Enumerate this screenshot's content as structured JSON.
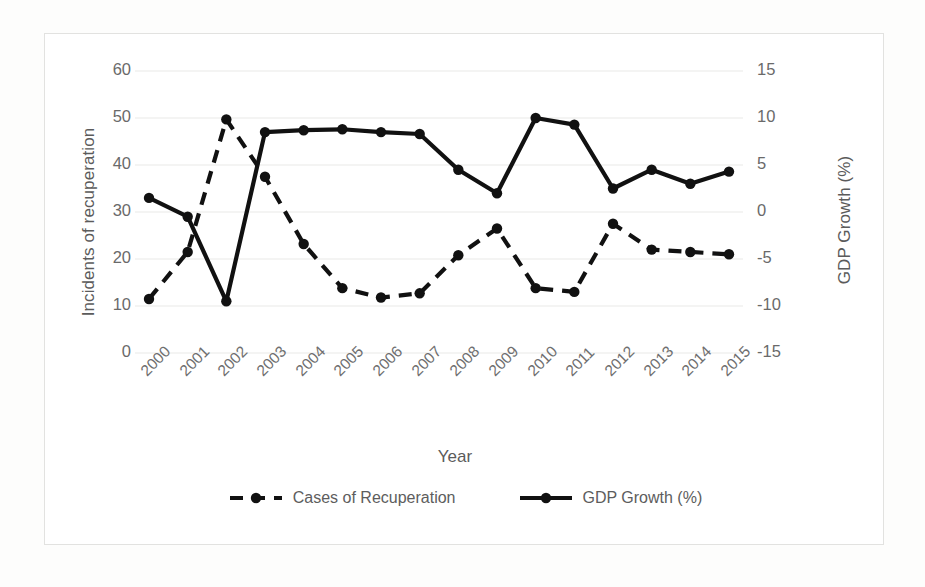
{
  "chart_data": {
    "type": "line",
    "title": "",
    "xlabel": "Year",
    "ylabel": "Incidents of recuperation",
    "y2label": "GDP Growth (%)",
    "categories": [
      "2000",
      "2001",
      "2002",
      "2003",
      "2004",
      "2005",
      "2006",
      "2007",
      "2008",
      "2009",
      "2010",
      "2011",
      "2012",
      "2013",
      "2014",
      "2015"
    ],
    "ylim": [
      0,
      60
    ],
    "yticks": [
      "0",
      "10",
      "20",
      "30",
      "40",
      "50",
      "60"
    ],
    "y2lim": [
      -15,
      15
    ],
    "y2ticks": [
      "-15",
      "-10",
      "-5",
      "0",
      "5",
      "10",
      "15"
    ],
    "grid": true,
    "legend_position": "bottom",
    "series": [
      {
        "name": "Cases of Recuperation",
        "axis": "left",
        "style": "dashed",
        "marker": "circle",
        "color": "#111111",
        "values": [
          11.5,
          21.5,
          49.7,
          37.5,
          23.2,
          13.8,
          11.8,
          12.7,
          20.8,
          26.5,
          13.8,
          13.0,
          27.5,
          22.0,
          21.5,
          21.0
        ]
      },
      {
        "name": "GDP Growth (%)",
        "axis": "right",
        "style": "solid",
        "marker": "circle",
        "color": "#111111",
        "values": [
          1.5,
          -0.5,
          -9.5,
          8.5,
          8.7,
          8.8,
          8.5,
          8.3,
          4.5,
          2.0,
          10.0,
          9.3,
          2.5,
          4.5,
          3.0,
          4.3
        ]
      }
    ]
  },
  "axes": {
    "y_left_title": "Incidents of recuperation",
    "y_right_title": "GDP Growth (%)",
    "x_title": "Year"
  },
  "legend": {
    "items": [
      {
        "label": "Cases of Recuperation",
        "style": "dashed"
      },
      {
        "label": "GDP Growth (%)",
        "style": "solid"
      }
    ]
  },
  "colors": {
    "series": "#111111",
    "grid": "#e9e9e7",
    "frame": "#e2e2e0",
    "text": "#6a6a6a",
    "background": "#fdfdfc"
  }
}
